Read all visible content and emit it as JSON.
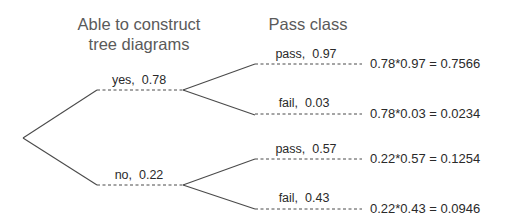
{
  "headers": {
    "level1_line1": "Able to construct",
    "level1_line2": "tree diagrams",
    "level2": "Pass class"
  },
  "branches": {
    "yes": {
      "label": "yes,  0.78",
      "outcome": "yes",
      "probability": 0.78,
      "children": [
        {
          "label": "pass,  0.97",
          "outcome": "pass",
          "probability": 0.97,
          "result": "0.78*0.97 = 0.7566"
        },
        {
          "label": "fail,  0.03",
          "outcome": "fail",
          "probability": 0.03,
          "result": "0.78*0.03 = 0.0234"
        }
      ]
    },
    "no": {
      "label": "no,  0.22",
      "outcome": "no",
      "probability": 0.22,
      "children": [
        {
          "label": "pass,  0.57",
          "outcome": "pass",
          "probability": 0.57,
          "result": "0.22*0.57 = 0.1254"
        },
        {
          "label": "fail,  0.43",
          "outcome": "fail",
          "probability": 0.43,
          "result": "0.22*0.43 = 0.0946"
        }
      ]
    }
  },
  "colors": {
    "line": "#4a4a4a",
    "header_text": "#5a5a5a",
    "label_text": "#2a2a2a",
    "background": "#ffffff"
  }
}
